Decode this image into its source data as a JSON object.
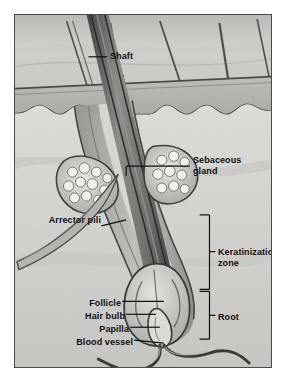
{
  "figure": {
    "frame_border_color": "#4a4a4a",
    "background_color": "#cfcfcb",
    "label_color": "#101010"
  },
  "labels": {
    "shaft": "Shaft",
    "sebaceous_gland_line1": "Sebaceous",
    "sebaceous_gland_line2": "gland",
    "arrector_pili": "Arrector pili",
    "keratinization_line1": "Keratinization",
    "keratinization_line2": "zone",
    "follicle": "Follicle",
    "hair_bulb": "Hair bulb",
    "papilla": "Papilla",
    "blood_vessel": "Blood vessel",
    "root": "Root"
  },
  "structures": {
    "epidermis": "epidermis-layer",
    "dermis": "dermis-layer",
    "hair_shaft": "hair-shaft",
    "follicle_wall": "follicle-wall",
    "sebaceous_gland_left": "sebaceous-gland-left",
    "sebaceous_gland_right": "sebaceous-gland-right",
    "arrector_pili_muscle": "arrector-pili-muscle",
    "hair_bulb": "hair-bulb",
    "dermal_papilla": "dermal-papilla",
    "blood_vessel": "blood-vessel",
    "surface_hairs": "surface-hairs"
  },
  "brackets": {
    "keratinization_zone": "keratinization-zone-bracket",
    "root": "root-bracket"
  }
}
